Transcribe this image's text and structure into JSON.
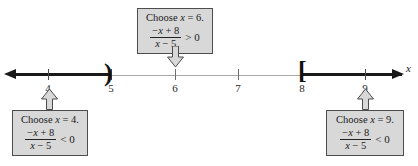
{
  "figure": {
    "type": "number-line-sign-chart",
    "axis_variable": "x"
  },
  "number_line": {
    "axis_label": "x",
    "tick_labels": [
      "4",
      "5",
      "6",
      "7",
      "8",
      "9"
    ],
    "brackets": [
      {
        "at": "5",
        "symbol": ")"
      },
      {
        "at": "8",
        "symbol": "["
      }
    ],
    "shaded_regions": [
      {
        "from": "-infinity",
        "to": "5",
        "style": "thick"
      },
      {
        "from": "8",
        "to": "+infinity",
        "style": "thick"
      }
    ]
  },
  "callouts": {
    "top": {
      "title_prefix": "Choose ",
      "title_var": "x",
      "title_suffix": " = 6.",
      "numerator_lead": "−",
      "numerator_var": "x",
      "numerator_rest": " + 8",
      "denominator_var": "x",
      "denominator_rest": " − 5",
      "relation": "> 0",
      "points_to": "6",
      "direction": "down"
    },
    "left": {
      "title_prefix": "Choose ",
      "title_var": "x",
      "title_suffix": " = 4.",
      "numerator_lead": "−",
      "numerator_var": "x",
      "numerator_rest": " + 8",
      "denominator_var": "x",
      "denominator_rest": " − 5",
      "relation": "< 0",
      "points_to": "4",
      "direction": "up"
    },
    "right": {
      "title_prefix": "Choose ",
      "title_var": "x",
      "title_suffix": " = 9.",
      "numerator_lead": "−",
      "numerator_var": "x",
      "numerator_rest": " + 8",
      "denominator_var": "x",
      "denominator_rest": " − 5",
      "relation": "< 0",
      "points_to": "9",
      "direction": "up"
    }
  },
  "colors": {
    "box_fill": "#d8d8d8",
    "box_border": "#4d4d4d",
    "line_thick": "#1a1a1a",
    "line_thin": "#a8a8a8"
  }
}
